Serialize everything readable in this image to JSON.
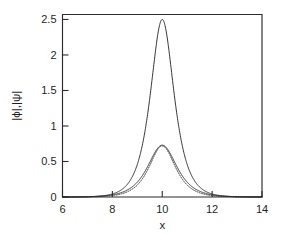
{
  "chart_data": {
    "type": "line",
    "title": "",
    "subtitle": "",
    "xlabel": "x",
    "ylabel": "|ϕ|,|ψ|",
    "xlim": [
      6,
      14
    ],
    "ylim": [
      0,
      2.57
    ],
    "xticks": [
      6,
      8,
      10,
      12,
      14
    ],
    "xtick_labels": [
      "6",
      "8",
      "10",
      "12",
      "14"
    ],
    "yticks": [
      0,
      0.5,
      1,
      1.5,
      2,
      2.5
    ],
    "ytick_labels": [
      "0",
      "0.5",
      "1",
      "1.5",
      "2",
      "2.5"
    ],
    "grid": false,
    "legend": "none",
    "frame": "box",
    "tick_direction": "in",
    "background_color": "#ffffff",
    "axis_color": "#2b2b2b",
    "series": [
      {
        "name": "tall-narrow-peak",
        "style": "solid",
        "color": "#2b2b2b",
        "center": 10.0,
        "amplitude": 2.5,
        "width_sigma": 0.42,
        "shape": "sech",
        "x": [
          6.0,
          7.0,
          7.5,
          8.0,
          8.25,
          8.5,
          8.75,
          9.0,
          9.25,
          9.5,
          9.75,
          10.0,
          10.25,
          10.5,
          10.75,
          11.0,
          11.25,
          11.5,
          11.75,
          12.0,
          12.5,
          13.0,
          14.0
        ],
        "y": [
          0.0,
          0.0,
          0.01,
          0.04,
          0.08,
          0.15,
          0.3,
          0.56,
          1.06,
          1.71,
          2.3,
          2.5,
          2.3,
          1.71,
          1.06,
          0.56,
          0.3,
          0.15,
          0.08,
          0.04,
          0.01,
          0.0,
          0.0
        ]
      },
      {
        "name": "low-broad-peak",
        "style": "solid",
        "color": "#2b2b2b",
        "center": 10.0,
        "amplitude": 0.73,
        "width_sigma": 0.52,
        "shape": "sech",
        "x": [
          6.0,
          7.0,
          7.5,
          8.0,
          8.25,
          8.5,
          8.75,
          9.0,
          9.25,
          9.5,
          9.75,
          10.0,
          10.25,
          10.5,
          10.75,
          11.0,
          11.25,
          11.5,
          11.75,
          12.0,
          12.5,
          13.0,
          14.0
        ],
        "y": [
          0.0,
          0.0,
          0.01,
          0.03,
          0.05,
          0.08,
          0.13,
          0.21,
          0.34,
          0.5,
          0.66,
          0.73,
          0.66,
          0.5,
          0.34,
          0.21,
          0.13,
          0.08,
          0.05,
          0.03,
          0.01,
          0.0,
          0.0
        ]
      },
      {
        "name": "low-dotted-peak",
        "style": "dotted",
        "color": "#2b2b2b",
        "center": 10.0,
        "amplitude": 0.72,
        "width_sigma": 0.47,
        "shape": "sech",
        "x": [
          6.0,
          7.0,
          7.5,
          8.0,
          8.25,
          8.5,
          8.75,
          9.0,
          9.25,
          9.5,
          9.75,
          10.0,
          10.25,
          10.5,
          10.75,
          11.0,
          11.25,
          11.5,
          11.75,
          12.0,
          12.5,
          13.0,
          14.0
        ],
        "y": [
          0.0,
          0.0,
          0.0,
          0.02,
          0.03,
          0.06,
          0.1,
          0.18,
          0.31,
          0.48,
          0.65,
          0.72,
          0.65,
          0.48,
          0.31,
          0.18,
          0.1,
          0.06,
          0.03,
          0.02,
          0.0,
          0.0,
          0.0
        ]
      }
    ]
  }
}
